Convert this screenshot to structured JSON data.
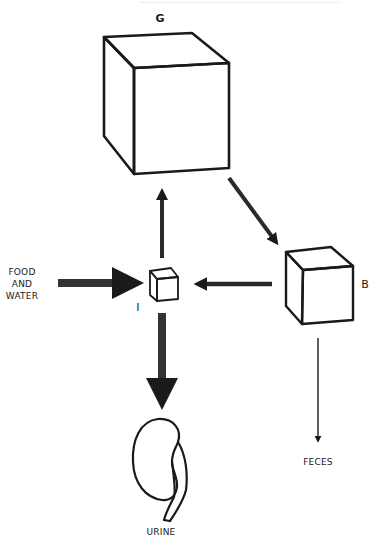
{
  "diagram": {
    "header_cutoff_text": "",
    "compartments": [
      {
        "id": "G",
        "label": "G",
        "size": "large"
      },
      {
        "id": "I",
        "label": "I",
        "size": "small"
      },
      {
        "id": "B",
        "label": "B",
        "size": "medium"
      }
    ],
    "inputs": {
      "food_water": [
        "FOOD",
        "AND",
        "WATER"
      ]
    },
    "outputs": {
      "urine": "URINE",
      "feces": "FECES"
    },
    "flows": [
      {
        "from": "FOOD AND WATER",
        "to": "I",
        "weight": "thick"
      },
      {
        "from": "I",
        "to": "G",
        "weight": "medium"
      },
      {
        "from": "G",
        "to": "B",
        "weight": "medium"
      },
      {
        "from": "B",
        "to": "I",
        "weight": "medium"
      },
      {
        "from": "I",
        "to": "URINE",
        "weight": "thick"
      },
      {
        "from": "B",
        "to": "FECES",
        "weight": "thin"
      }
    ],
    "colors": {
      "ink": "#1a1a1a",
      "background": "#ffffff"
    }
  }
}
